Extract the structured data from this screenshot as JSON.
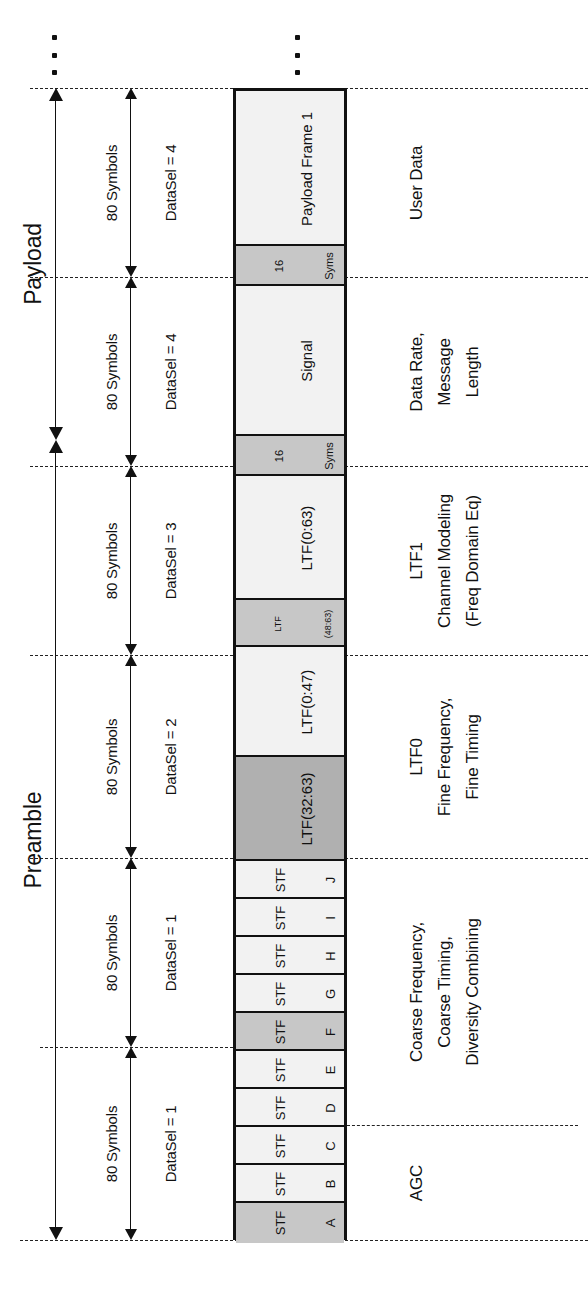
{
  "diagram": {
    "title_left_brackets": [
      {
        "label": "Payload",
        "top": 88,
        "bottom": 440
      },
      {
        "label": "Preamble",
        "top": 440,
        "bottom": 1240
      }
    ],
    "ellipsis_marker": "vertical-ellipsis",
    "segments": [
      {
        "id": "payload1",
        "symbols": "80 Symbols",
        "datasel": "DataSel = 4",
        "top": 88,
        "bottom": 277
      },
      {
        "id": "signal",
        "symbols": "80 Symbols",
        "datasel": "DataSel = 4",
        "top": 277,
        "bottom": 466
      },
      {
        "id": "ltf1",
        "symbols": "80 Symbols",
        "datasel": "DataSel = 3",
        "top": 466,
        "bottom": 655
      },
      {
        "id": "ltf0",
        "symbols": "80 Symbols",
        "datasel": "DataSel = 2",
        "top": 655,
        "bottom": 858
      },
      {
        "id": "stf_hi",
        "symbols": "80 Symbols",
        "datasel": "DataSel = 1",
        "top": 858,
        "bottom": 1047
      },
      {
        "id": "stf_lo",
        "symbols": "80 Symbols",
        "datasel": "DataSel = 1",
        "top": 1047,
        "bottom": 1240
      }
    ],
    "blocks": [
      {
        "name": "payload-frame-1",
        "label": "Payload Frame 1",
        "sub": "",
        "fill": "light",
        "top": 0,
        "height": 155,
        "size": "big"
      },
      {
        "name": "gap-16-syms-1",
        "label": "16",
        "sub": "Syms",
        "fill": "med",
        "top": 155,
        "height": 40,
        "size": "small"
      },
      {
        "name": "signal",
        "label": "Signal",
        "sub": "",
        "fill": "light",
        "top": 195,
        "height": 150,
        "size": "big"
      },
      {
        "name": "gap-16-syms-2",
        "label": "16",
        "sub": "Syms",
        "fill": "med",
        "top": 345,
        "height": 40,
        "size": "small"
      },
      {
        "name": "ltf-0-63",
        "label": "LTF(0:63)",
        "sub": "",
        "fill": "light",
        "top": 385,
        "height": 124,
        "size": "mid"
      },
      {
        "name": "ltf-48-63",
        "label": "LTF",
        "sub": "(48:63)",
        "fill": "med",
        "top": 509,
        "height": 47,
        "size": "xsmall"
      },
      {
        "name": "ltf-0-47",
        "label": "LTF(0:47)",
        "sub": "",
        "fill": "light",
        "top": 556,
        "height": 110,
        "size": "mid"
      },
      {
        "name": "ltf-32-63",
        "label": "LTF(32:63)",
        "sub": "",
        "fill": "dark",
        "top": 666,
        "height": 104,
        "size": "mid"
      },
      {
        "name": "stf-j",
        "label": "STF",
        "sub": "J",
        "fill": "light",
        "top": 770,
        "height": 38,
        "size": "stf"
      },
      {
        "name": "stf-i",
        "label": "STF",
        "sub": "I",
        "fill": "light",
        "top": 808,
        "height": 38,
        "size": "stf"
      },
      {
        "name": "stf-h",
        "label": "STF",
        "sub": "H",
        "fill": "light",
        "top": 846,
        "height": 38,
        "size": "stf"
      },
      {
        "name": "stf-g",
        "label": "STF",
        "sub": "G",
        "fill": "light",
        "top": 884,
        "height": 38,
        "size": "stf"
      },
      {
        "name": "stf-f",
        "label": "STF",
        "sub": "F",
        "fill": "med",
        "top": 922,
        "height": 38,
        "size": "stf"
      },
      {
        "name": "stf-e",
        "label": "STF",
        "sub": "E",
        "fill": "light",
        "top": 960,
        "height": 38,
        "size": "stf"
      },
      {
        "name": "stf-d",
        "label": "STF",
        "sub": "D",
        "fill": "light",
        "top": 998,
        "height": 38,
        "size": "stf"
      },
      {
        "name": "stf-c",
        "label": "STF",
        "sub": "C",
        "fill": "light",
        "top": 1036,
        "height": 38,
        "size": "stf"
      },
      {
        "name": "stf-b",
        "label": "STF",
        "sub": "B",
        "fill": "light",
        "top": 1074,
        "height": 38,
        "size": "stf"
      },
      {
        "name": "stf-a",
        "label": "STF",
        "sub": "A",
        "fill": "med",
        "top": 1112,
        "height": 40,
        "size": "stf"
      }
    ],
    "descriptions": [
      {
        "name": "desc-user-data",
        "lines": [
          "User Data"
        ],
        "top": 88,
        "bottom": 277
      },
      {
        "name": "desc-signal",
        "lines": [
          "Data Rate,",
          "Message",
          "Length"
        ],
        "top": 277,
        "bottom": 466
      },
      {
        "name": "desc-ltf1",
        "lines": [
          "LTF1",
          "Channel Modeling",
          "(Freq Domain Eq)"
        ],
        "top": 466,
        "bottom": 655
      },
      {
        "name": "desc-ltf0",
        "lines": [
          "LTF0",
          "Fine Frequency,",
          "Fine Timing"
        ],
        "top": 655,
        "bottom": 858
      },
      {
        "name": "desc-stf",
        "lines": [
          "Coarse Frequency,",
          "Coarse Timing,",
          "Diversity Combining"
        ],
        "top": 858,
        "bottom": 1125
      },
      {
        "name": "desc-agc",
        "lines": [
          "AGC"
        ],
        "top": 1125,
        "bottom": 1240
      }
    ],
    "guide_lines": [
      {
        "name": "guide-top",
        "y": 88,
        "x1": 30,
        "x2": 588,
        "full": true
      },
      {
        "name": "guide-payload1",
        "y": 277,
        "x1": 30,
        "x2": 588,
        "full": true
      },
      {
        "name": "guide-signal",
        "y": 466,
        "x1": 30,
        "x2": 588,
        "full": true
      },
      {
        "name": "guide-ltf1",
        "y": 655,
        "x1": 30,
        "x2": 588,
        "full": true
      },
      {
        "name": "guide-ltf0",
        "y": 858,
        "x1": 30,
        "x2": 588,
        "full": true
      },
      {
        "name": "guide-stf-f",
        "y": 1047,
        "x1": 40,
        "x2": 233,
        "full": false
      },
      {
        "name": "guide-agc",
        "y": 1125,
        "x1": 347,
        "x2": 578,
        "full": false
      },
      {
        "name": "guide-bottom",
        "y": 1240,
        "x1": 20,
        "x2": 588,
        "full": true
      }
    ]
  }
}
